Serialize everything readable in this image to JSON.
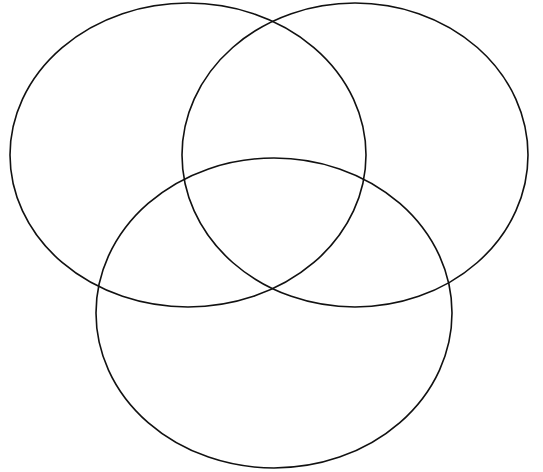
{
  "diagram": {
    "type": "venn",
    "set_count": 3,
    "background": "#ffffff",
    "stroke_color": "#111111",
    "sets": [
      {
        "id": "set-a",
        "position": "top-left",
        "cx": 188,
        "cy": 155,
        "rx": 178,
        "ry": 152,
        "label": ""
      },
      {
        "id": "set-b",
        "position": "top-right",
        "cx": 355,
        "cy": 155,
        "rx": 173,
        "ry": 152,
        "label": ""
      },
      {
        "id": "set-c",
        "position": "bottom",
        "cx": 274,
        "cy": 313,
        "rx": 178,
        "ry": 155,
        "label": ""
      }
    ]
  }
}
